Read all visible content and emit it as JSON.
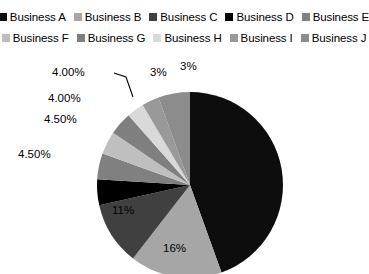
{
  "legend": {
    "position": "top",
    "rows": [
      [
        {
          "label": "Business A",
          "color": "#0d0d0d"
        },
        {
          "label": "Business B",
          "color": "#a6a6a6"
        },
        {
          "label": "Business C",
          "color": "#404040"
        },
        {
          "label": "Business D",
          "color": "#000000"
        },
        {
          "label": "Business E",
          "color": "#808080"
        }
      ],
      [
        {
          "label": "Business F",
          "color": "#bfbfbf"
        },
        {
          "label": "Business G",
          "color": "#7f7f7f"
        },
        {
          "label": "Business H",
          "color": "#d9d9d9"
        },
        {
          "label": "Business I",
          "color": "#999999"
        },
        {
          "label": "Business J",
          "color": "#8c8c8c"
        }
      ]
    ]
  },
  "chart_data": {
    "type": "pie",
    "title": "",
    "labels": [
      "Business A",
      "Business B",
      "Business C",
      "Business D",
      "Business E",
      "Business F",
      "Business G",
      "Business H",
      "Business I",
      "Business J"
    ],
    "values": [
      44.5,
      16,
      11,
      4.5,
      4.5,
      4.0,
      4.0,
      3.0,
      3.0,
      5.5
    ],
    "value_labels": [
      "",
      "16%",
      "11%",
      "4.50%",
      "4.50%",
      "4.00%",
      "4.00%",
      "3%",
      "3%",
      ""
    ],
    "colors": [
      "#0d0d0d",
      "#a6a6a6",
      "#404040",
      "#000000",
      "#808080",
      "#bfbfbf",
      "#7f7f7f",
      "#d9d9d9",
      "#999999",
      "#8c8c8c"
    ],
    "start_angle": 0,
    "direction": "clockwise",
    "legend": true,
    "data_labels_shown": [
      "16%",
      "11%",
      "4.50%",
      "4.50%",
      "4.00%",
      "4.00%",
      "3%",
      "3%"
    ]
  },
  "labels": {
    "pct_16": "16%",
    "pct_11": "11%",
    "pct_45_a": "4.50%",
    "pct_45_b": "4.50%",
    "pct_40_a": "4.00%",
    "pct_40_b": "4.00%",
    "pct_3_a": "3%",
    "pct_3_b": "3%"
  }
}
